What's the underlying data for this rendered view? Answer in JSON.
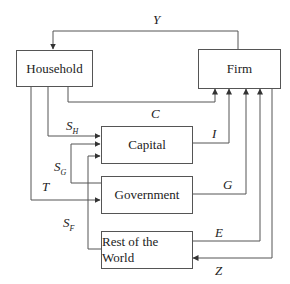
{
  "nodes": {
    "household": "Household",
    "firm": "Firm",
    "capital": "Capital",
    "government": "Government",
    "rest_of_world": "Rest of the World"
  },
  "flows": {
    "Y": {
      "label": "Y",
      "from": "Firm",
      "to": "Household"
    },
    "C": {
      "label": "C",
      "from": "Household",
      "to": "Firm"
    },
    "S_H": {
      "label": "S",
      "sub": "H",
      "from": "Household",
      "to": "Capital"
    },
    "S_G": {
      "label": "S",
      "sub": "G",
      "from": "Government",
      "to": "Capital"
    },
    "T": {
      "label": "T",
      "from": "Household",
      "to": "Government"
    },
    "S_F": {
      "label": "S",
      "sub": "F",
      "from": "Rest of the World",
      "to": "Capital"
    },
    "I": {
      "label": "I",
      "from": "Capital",
      "to": "Firm"
    },
    "G": {
      "label": "G",
      "from": "Government",
      "to": "Firm"
    },
    "E": {
      "label": "E",
      "from": "Rest of the World",
      "to": "Firm"
    },
    "Z": {
      "label": "Z",
      "from": "Firm",
      "to": "Rest of the World"
    }
  },
  "colors": {
    "line": "#555555",
    "text": "#222222"
  }
}
